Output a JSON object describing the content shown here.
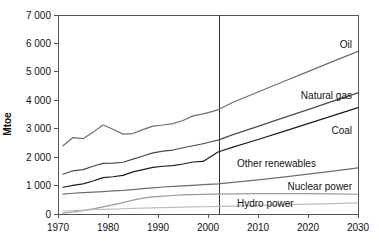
{
  "chart_data": {
    "type": "line",
    "title": "",
    "xlabel": "",
    "ylabel": "Mtoe",
    "xlim": [
      1970,
      2030
    ],
    "ylim": [
      0,
      7000
    ],
    "grid": false,
    "legend_position": "inline-right-of-series",
    "xticks": [
      "1970",
      "1980",
      "1990",
      "2000",
      "2010",
      "2020",
      "2030"
    ],
    "xtick_values": [
      1970,
      1980,
      1990,
      2000,
      2010,
      2020,
      2030
    ],
    "yticks": [
      "0",
      "1 000",
      "2 000",
      "3 000",
      "4 000",
      "5 000",
      "6 000",
      "7 000"
    ],
    "ytick_values": [
      0,
      1000,
      2000,
      3000,
      4000,
      5000,
      6000,
      7000
    ],
    "annotations": [
      {
        "name": "projection-divider",
        "type": "vline",
        "x": 2002,
        "label": ""
      }
    ],
    "x": [
      1971,
      1973,
      1975,
      1977,
      1979,
      1981,
      1983,
      1985,
      1987,
      1989,
      1991,
      1993,
      1995,
      1997,
      1999,
      2001,
      2002,
      2005,
      2010,
      2015,
      2020,
      2025,
      2030
    ],
    "series": [
      {
        "name": "Oil",
        "label": "Oil",
        "color": "#6e6e6e",
        "values": [
          2400,
          2690,
          2650,
          2880,
          3130,
          2980,
          2810,
          2830,
          2970,
          3090,
          3130,
          3180,
          3290,
          3450,
          3520,
          3610,
          3670,
          3930,
          4290,
          4650,
          5010,
          5370,
          5720
        ]
      },
      {
        "name": "Natural gas",
        "label": "Natural gas",
        "color": "#4a4a4a",
        "values": [
          1400,
          1520,
          1560,
          1680,
          1780,
          1790,
          1820,
          1930,
          2040,
          2150,
          2210,
          2250,
          2330,
          2400,
          2470,
          2560,
          2600,
          2790,
          3080,
          3380,
          3670,
          3970,
          4260
        ]
      },
      {
        "name": "Coal",
        "label": "Coal",
        "color": "#1c1c1c",
        "values": [
          940,
          1010,
          1060,
          1160,
          1280,
          1310,
          1360,
          1480,
          1560,
          1640,
          1680,
          1700,
          1760,
          1830,
          1850,
          2070,
          2180,
          2350,
          2620,
          2900,
          3180,
          3460,
          3740
        ]
      },
      {
        "name": "Other renewables",
        "label": "Other renewables",
        "color": "#6e6e6e",
        "values": [
          700,
          730,
          750,
          770,
          790,
          810,
          830,
          860,
          890,
          920,
          950,
          970,
          990,
          1010,
          1030,
          1050,
          1060,
          1110,
          1200,
          1300,
          1400,
          1510,
          1620
        ]
      },
      {
        "name": "Nuclear power",
        "label": "Nuclear power",
        "color": "#9a9a9a",
        "values": [
          30,
          70,
          120,
          180,
          250,
          320,
          400,
          490,
          560,
          600,
          630,
          650,
          670,
          680,
          690,
          700,
          700,
          710,
          720,
          720,
          715,
          705,
          695
        ]
      },
      {
        "name": "Hydro power",
        "label": "Hydro power",
        "color": "#bdbdbd",
        "values": [
          105,
          120,
          135,
          150,
          165,
          175,
          185,
          195,
          205,
          215,
          225,
          232,
          240,
          248,
          255,
          262,
          266,
          278,
          300,
          322,
          344,
          366,
          388
        ]
      }
    ]
  }
}
